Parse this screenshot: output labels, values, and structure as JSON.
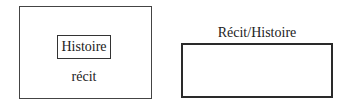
{
  "left_diagram": {
    "inner_label": "Histoire",
    "outer_label": "récit"
  },
  "right_diagram": {
    "label": "Récit/Histoire"
  }
}
